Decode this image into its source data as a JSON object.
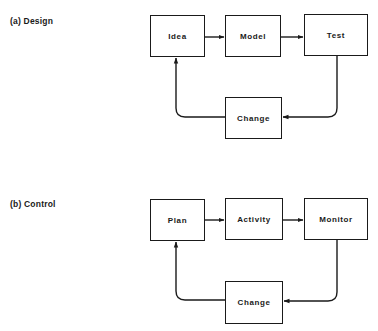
{
  "diagrams": [
    {
      "label": "(a)  Design",
      "nodes": {
        "n1": "Idea",
        "n2": "Model",
        "n3": "Test",
        "feedback": "Change"
      },
      "edges": [
        [
          "Idea",
          "Model"
        ],
        [
          "Model",
          "Test"
        ],
        [
          "Test",
          "Change"
        ],
        [
          "Change",
          "Idea"
        ]
      ]
    },
    {
      "label": "(b)  Control",
      "nodes": {
        "n1": "Plan",
        "n2": "Activity",
        "n3": "Monitor",
        "feedback": "Change"
      },
      "edges": [
        [
          "Plan",
          "Activity"
        ],
        [
          "Activity",
          "Monitor"
        ],
        [
          "Monitor",
          "Change"
        ],
        [
          "Change",
          "Plan"
        ]
      ]
    }
  ],
  "colors": {
    "stroke": "#1a1a1a",
    "background": "#ffffff"
  }
}
